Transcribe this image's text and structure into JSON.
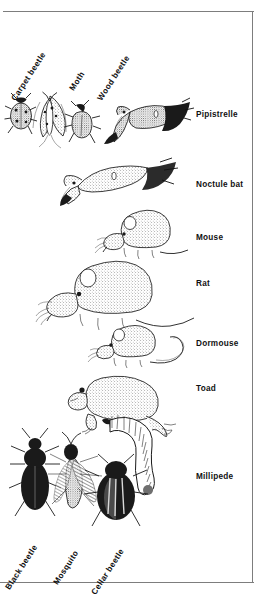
{
  "plate": {
    "title": "Household pests size comparison plate",
    "background_color": "#ffffff",
    "frame_color": "#7d7d7d",
    "ink_color": "#1a1a1a"
  },
  "top_labels": [
    {
      "id": "carpet-beetle",
      "text": "Carpet beetle",
      "x": 14,
      "y": 96,
      "rotation": -57
    },
    {
      "id": "moth",
      "text": "Moth",
      "x": 72,
      "y": 86,
      "rotation": -57
    },
    {
      "id": "wood-beetle",
      "text": "Wood beetle",
      "x": 100,
      "y": 96,
      "rotation": -57
    }
  ],
  "side_labels": [
    {
      "id": "pipistrelle",
      "text": "Pipistrelle",
      "y": 111
    },
    {
      "id": "noctule-bat",
      "text": "Noctule bat",
      "y": 181
    },
    {
      "id": "mouse",
      "text": "Mouse",
      "y": 234
    },
    {
      "id": "rat",
      "text": "Rat",
      "y": 280
    },
    {
      "id": "dormouse",
      "text": "Dormouse",
      "y": 340
    },
    {
      "id": "toad",
      "text": "Toad",
      "y": 385
    },
    {
      "id": "millipede",
      "text": "Millipede",
      "y": 473
    }
  ],
  "bottom_labels": [
    {
      "id": "black-beetle",
      "text": "Black beetle",
      "x": 8,
      "y": 585,
      "rotation": -57
    },
    {
      "id": "mosquito",
      "text": "Mosquito",
      "x": 56,
      "y": 580,
      "rotation": -57
    },
    {
      "id": "cellar-beetle",
      "text": "Cellar beetle",
      "x": 94,
      "y": 590,
      "rotation": -57
    }
  ],
  "figures": [
    {
      "id": "carpet-beetle-figure",
      "label": "Carpet beetle",
      "group": "top-insects"
    },
    {
      "id": "moth-figure",
      "label": "Moth",
      "group": "top-insects"
    },
    {
      "id": "wood-beetle-figure",
      "label": "Wood beetle",
      "group": "top-insects"
    },
    {
      "id": "pipistrelle-figure",
      "label": "Pipistrelle",
      "group": "mammals"
    },
    {
      "id": "noctule-bat-figure",
      "label": "Noctule bat",
      "group": "mammals"
    },
    {
      "id": "mouse-figure",
      "label": "Mouse",
      "group": "mammals"
    },
    {
      "id": "rat-figure",
      "label": "Rat",
      "group": "mammals"
    },
    {
      "id": "dormouse-figure",
      "label": "Dormouse",
      "group": "mammals"
    },
    {
      "id": "toad-figure",
      "label": "Toad",
      "group": "amphibians"
    },
    {
      "id": "millipede-figure",
      "label": "Millipede",
      "group": "invertebrates"
    },
    {
      "id": "black-beetle-figure",
      "label": "Black beetle",
      "group": "bottom-insects"
    },
    {
      "id": "mosquito-figure",
      "label": "Mosquito",
      "group": "bottom-insects"
    },
    {
      "id": "cellar-beetle-figure",
      "label": "Cellar beetle",
      "group": "bottom-insects"
    }
  ]
}
